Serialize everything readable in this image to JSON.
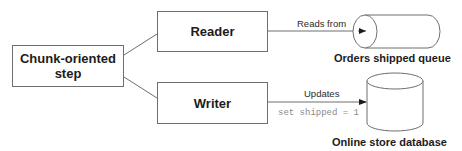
{
  "diagram": {
    "nodes": {
      "chunk_step": {
        "label_line1": "Chunk-oriented",
        "label_line2": "step"
      },
      "reader": {
        "label": "Reader"
      },
      "writer": {
        "label": "Writer"
      },
      "queue": {
        "label": "Orders shipped queue",
        "shape": "horizontal-cylinder"
      },
      "database": {
        "label": "Online store database",
        "shape": "vertical-cylinder"
      }
    },
    "edges": {
      "reads_from": {
        "label": "Reads from",
        "from": "reader",
        "to": "queue"
      },
      "updates": {
        "label": "Updates",
        "annotation": "set shipped = 1",
        "from": "writer",
        "to": "database"
      }
    },
    "colors": {
      "stroke": "#6e6e6e",
      "text": "#1c1c1c",
      "code_text": "#8a8a8a"
    }
  }
}
